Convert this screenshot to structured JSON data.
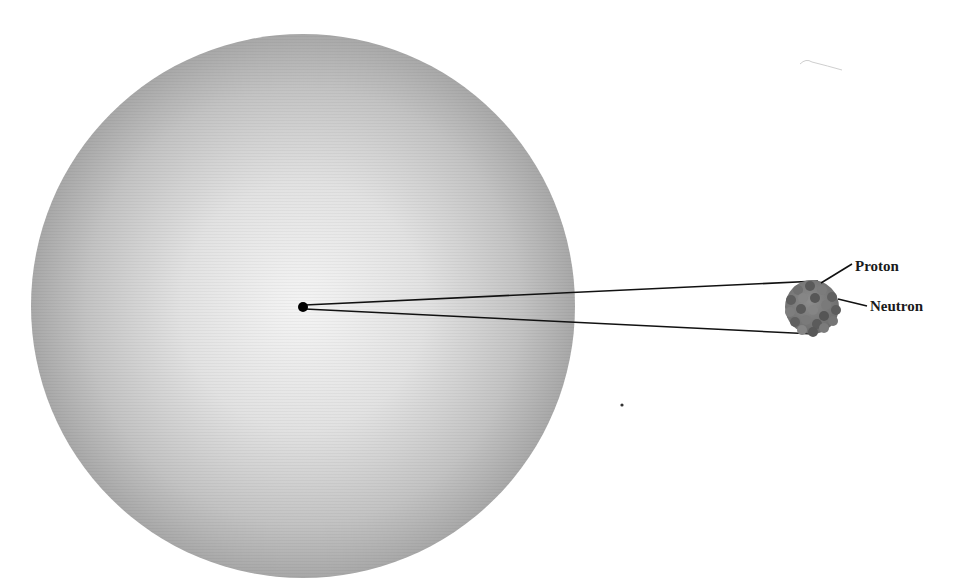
{
  "diagram": {
    "type": "atom-scale-diagram",
    "atom": {
      "center": [
        303,
        306
      ],
      "radius": 272,
      "fill_center": "#f2f2f2",
      "fill_edge": "#a9a9a9"
    },
    "nucleus_dot": {
      "center": [
        303,
        307
      ],
      "radius": 5,
      "color": "#000000"
    },
    "magnified_nucleus": {
      "center": [
        812,
        307
      ],
      "radius": 27,
      "proton_color": "#7a7a7a",
      "neutron_color": "#5e5e5e"
    },
    "zoom_lines": {
      "upper": [
        [
          305,
          305
        ],
        [
          818,
          281
        ]
      ],
      "lower": [
        [
          305,
          309
        ],
        [
          814,
          334
        ]
      ]
    },
    "labels": {
      "proton": "Proton",
      "neutron": "Neutron"
    },
    "leader_lines": {
      "proton": [
        [
          821,
          283
        ],
        [
          852,
          264
        ]
      ],
      "neutron": [
        [
          838,
          299
        ],
        [
          867,
          306
        ]
      ]
    }
  }
}
